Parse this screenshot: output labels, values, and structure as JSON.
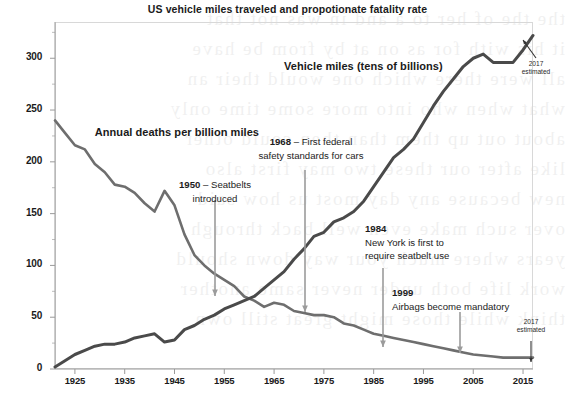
{
  "chart_data": {
    "type": "line",
    "title": "US vehicle miles traveled and propotionate fatality rate",
    "xlabel": "",
    "ylabel": "",
    "xlim": [
      1921,
      2017
    ],
    "ylim": [
      0,
      335
    ],
    "grid": false,
    "legend_position": "inline-labels",
    "xticks": [
      "1925",
      "1935",
      "1945",
      "1955",
      "1965",
      "1975",
      "1985",
      "1995",
      "2005",
      "2015"
    ],
    "xtick_values": [
      1925,
      1935,
      1945,
      1955,
      1965,
      1975,
      1985,
      1995,
      2005,
      2015
    ],
    "yticks": [
      "0",
      "50",
      "100",
      "150",
      "200",
      "250",
      "300"
    ],
    "ytick_values": [
      0,
      50,
      100,
      150,
      200,
      250,
      300
    ],
    "series": [
      {
        "name": "Annual deaths per billion miles",
        "color": "#6e6e6e",
        "label_x": 1929,
        "label_y": 228,
        "x": [
          1921,
          1923,
          1925,
          1927,
          1929,
          1931,
          1933,
          1935,
          1937,
          1939,
          1941,
          1943,
          1945,
          1947,
          1949,
          1951,
          1953,
          1955,
          1957,
          1959,
          1961,
          1963,
          1965,
          1967,
          1969,
          1971,
          1973,
          1975,
          1977,
          1979,
          1981,
          1983,
          1985,
          1987,
          1989,
          1991,
          1993,
          1995,
          1997,
          1999,
          2001,
          2003,
          2005,
          2007,
          2009,
          2011,
          2013,
          2015,
          2017
        ],
        "y": [
          240,
          228,
          216,
          212,
          198,
          190,
          178,
          176,
          170,
          160,
          152,
          172,
          158,
          130,
          110,
          100,
          92,
          86,
          80,
          70,
          66,
          60,
          64,
          62,
          56,
          54,
          52,
          52,
          50,
          44,
          42,
          38,
          34,
          32,
          30,
          28,
          26,
          24,
          22,
          20,
          18,
          16,
          14,
          13,
          12,
          11,
          11,
          11,
          11
        ]
      },
      {
        "name": "Vehicle miles (tens of billions)",
        "color": "#4a4a4a",
        "label_x": 1967,
        "label_y": 292,
        "x": [
          1921,
          1923,
          1925,
          1927,
          1929,
          1931,
          1933,
          1935,
          1937,
          1939,
          1941,
          1943,
          1945,
          1947,
          1949,
          1951,
          1953,
          1955,
          1957,
          1959,
          1961,
          1963,
          1965,
          1967,
          1969,
          1971,
          1973,
          1975,
          1977,
          1979,
          1981,
          1983,
          1985,
          1987,
          1989,
          1991,
          1993,
          1995,
          1997,
          1999,
          2001,
          2003,
          2005,
          2007,
          2009,
          2011,
          2013,
          2015,
          2017
        ],
        "y": [
          2,
          8,
          14,
          18,
          22,
          24,
          24,
          26,
          30,
          32,
          34,
          26,
          28,
          38,
          42,
          48,
          52,
          58,
          62,
          66,
          70,
          78,
          86,
          94,
          106,
          116,
          128,
          132,
          142,
          146,
          152,
          162,
          176,
          190,
          204,
          212,
          222,
          238,
          254,
          268,
          280,
          292,
          300,
          304,
          296,
          296,
          296,
          308,
          322
        ]
      }
    ],
    "annotations": [
      {
        "id": "seatbelts-1950",
        "year": "1950",
        "dash": "–",
        "text_line1": "Seatbelts",
        "text_line2": "introduced",
        "arrow_from": [
          215,
          200
        ],
        "arrow_to": [
          215,
          296
        ]
      },
      {
        "id": "federal-standards-1968",
        "year": "1968",
        "dash": "–",
        "text_line1": "First federal",
        "text_line2": "safety standards for cars",
        "arrow_from": [
          305,
          170
        ],
        "arrow_to": [
          305,
          312
        ]
      },
      {
        "id": "ny-seatbelt-1984",
        "year": "1984",
        "dash": "",
        "text_line1": "New York is first to",
        "text_line2": "require seatbelt use",
        "arrow_from": [
          383,
          268
        ],
        "arrow_to": [
          383,
          347
        ]
      },
      {
        "id": "airbags-1999",
        "year": "1999",
        "dash": "",
        "text_line1": "Airbags become mandatory",
        "text_line2": "",
        "arrow_from": [
          460,
          312
        ],
        "arrow_to": [
          460,
          353
        ]
      }
    ],
    "estimates": [
      {
        "id": "vehicle-miles-2017-estimated",
        "line1": "2017",
        "line2": "estimated",
        "arrow_from": [
          536,
          58
        ],
        "arrow_to": [
          523,
          40
        ]
      },
      {
        "id": "deaths-2017-estimated",
        "line1": "2017",
        "line2": "estimated",
        "arrow_from": [
          531,
          341
        ],
        "arrow_to": [
          531,
          362
        ]
      }
    ]
  },
  "background": {
    "bleed_text": "the the of her to a and in was not that\nit his with for as on at by from be have\nall were there which one would their an\nwhat when who into more some time only\nabout out up them than then could other\nlike after our these two may first also\nnew because any day most us how said\nover such make even well back through\nyears where much your way down should\nwork life both under never same another\nthink while those might great still own"
  }
}
